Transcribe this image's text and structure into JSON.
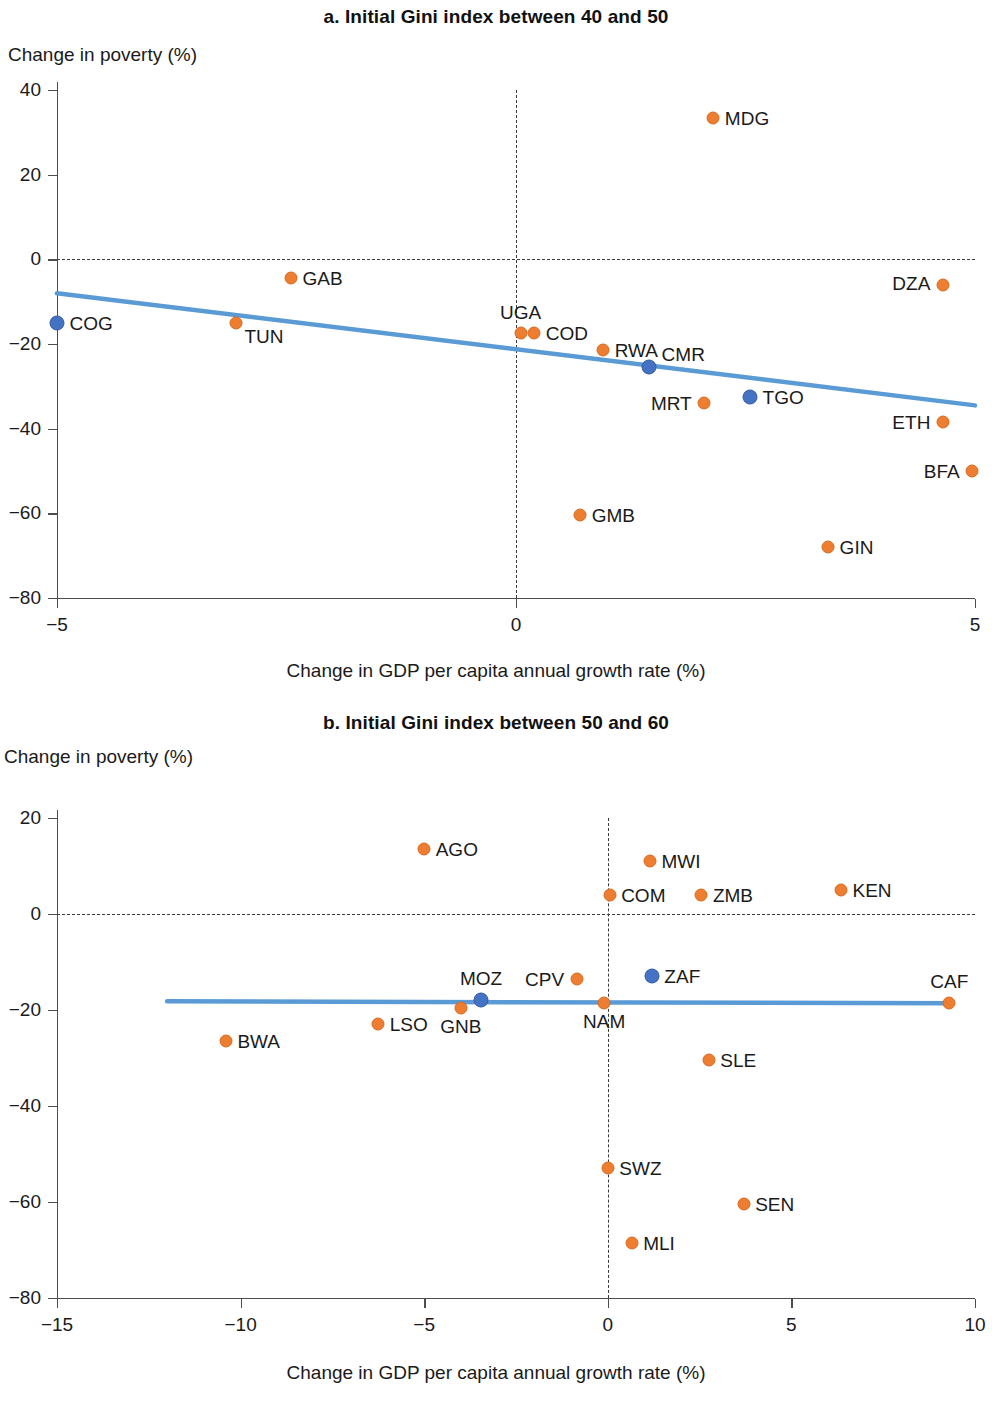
{
  "figure": {
    "shared_xlabel": "Change in GDP per capita annual growth rate (%)",
    "shared_ylabel": "Change in poverty (%)",
    "colors": {
      "orange": "#ED7D31",
      "blue": "#4472C4",
      "trendline": "#5B9BD5",
      "axis": "#4d4d4d"
    }
  },
  "panel_a": {
    "title": "a. Initial Gini index between 40 and 50",
    "ylabel": "Change in poverty (%)",
    "xlabel": "Change in GDP per capita annual growth rate (%)",
    "yticks": [
      "40",
      "20",
      "0",
      "−20",
      "−40",
      "−60",
      "−80"
    ],
    "xticks": [
      "−5",
      "0",
      "5"
    ]
  },
  "panel_b": {
    "title": "b. Initial Gini index between 50 and 60",
    "ylabel": "Change in poverty (%)",
    "xlabel": "Change in GDP per capita annual growth rate (%)",
    "yticks": [
      "20",
      "0",
      "−20",
      "−40",
      "−60",
      "−80"
    ],
    "xticks": [
      "−15",
      "−10",
      "−5",
      "0",
      "5",
      "10"
    ]
  },
  "chart_data": [
    {
      "type": "scatter",
      "panel": "a",
      "title": "a. Initial Gini index between 40 and 50",
      "xlabel": "Change in GDP per capita annual growth rate (%)",
      "ylabel": "Change in poverty (%)",
      "xlim": [
        -5,
        5
      ],
      "ylim": [
        -80,
        40
      ],
      "xticks": [
        -5,
        0,
        5
      ],
      "yticks": [
        40,
        20,
        0,
        -20,
        -40,
        -60,
        -80
      ],
      "grid": false,
      "reference_lines": {
        "horizontal_dashed_y": 0,
        "vertical_dashed_x": 0
      },
      "trendline": {
        "x": [
          -5,
          5
        ],
        "y": [
          -8.0,
          -34.5
        ],
        "color": "#5B9BD5"
      },
      "points": [
        {
          "label": "COG",
          "x": -5.0,
          "y": -15.0,
          "color": "blue",
          "label_pos": "right"
        },
        {
          "label": "TUN",
          "x": -3.05,
          "y": -15.0,
          "color": "orange",
          "label_pos": "right-below"
        },
        {
          "label": "GAB",
          "x": -2.45,
          "y": -4.5,
          "color": "orange",
          "label_pos": "right"
        },
        {
          "label": "UGA",
          "x": 0.05,
          "y": -17.5,
          "color": "orange",
          "label_pos": "above"
        },
        {
          "label": "COD",
          "x": 0.2,
          "y": -17.5,
          "color": "orange",
          "label_pos": "right"
        },
        {
          "label": "RWA",
          "x": 0.95,
          "y": -21.5,
          "color": "orange",
          "label_pos": "right"
        },
        {
          "label": "CMR",
          "x": 1.45,
          "y": -25.5,
          "color": "blue",
          "label_pos": "right-above"
        },
        {
          "label": "MDG",
          "x": 2.15,
          "y": 33.5,
          "color": "orange",
          "label_pos": "right"
        },
        {
          "label": "MRT",
          "x": 2.05,
          "y": -34.0,
          "color": "orange",
          "label_pos": "left"
        },
        {
          "label": "TGO",
          "x": 2.55,
          "y": -32.5,
          "color": "blue",
          "label_pos": "right"
        },
        {
          "label": "DZA",
          "x": 4.65,
          "y": -6.0,
          "color": "orange",
          "label_pos": "left-above"
        },
        {
          "label": "ETH",
          "x": 4.65,
          "y": -38.5,
          "color": "orange",
          "label_pos": "left"
        },
        {
          "label": "BFA",
          "x": 4.97,
          "y": -50.0,
          "color": "orange",
          "label_pos": "left"
        },
        {
          "label": "GMB",
          "x": 0.7,
          "y": -60.5,
          "color": "orange",
          "label_pos": "right"
        },
        {
          "label": "GIN",
          "x": 3.4,
          "y": -68.0,
          "color": "orange",
          "label_pos": "right"
        }
      ]
    },
    {
      "type": "scatter",
      "panel": "b",
      "title": "b. Initial Gini index between 50 and 60",
      "xlabel": "Change in GDP per capita annual growth rate (%)",
      "ylabel": "Change in poverty (%)",
      "xlim": [
        -15,
        10
      ],
      "ylim": [
        -80,
        20
      ],
      "xticks": [
        -15,
        -10,
        -5,
        0,
        5,
        10
      ],
      "yticks": [
        20,
        0,
        -20,
        -40,
        -60,
        -80
      ],
      "grid": false,
      "reference_lines": {
        "horizontal_dashed_y": 0,
        "vertical_dashed_x": 0
      },
      "trendline": {
        "x": [
          -12.0,
          9.3
        ],
        "y": [
          -18.2,
          -18.6
        ],
        "color": "#5B9BD5"
      },
      "points": [
        {
          "label": "AGO",
          "x": -5.0,
          "y": 13.5,
          "color": "orange",
          "label_pos": "right"
        },
        {
          "label": "MWI",
          "x": 1.15,
          "y": 11.0,
          "color": "orange",
          "label_pos": "right"
        },
        {
          "label": "COM",
          "x": 0.05,
          "y": 4.0,
          "color": "orange",
          "label_pos": "right"
        },
        {
          "label": "ZMB",
          "x": 2.55,
          "y": 4.0,
          "color": "orange",
          "label_pos": "right"
        },
        {
          "label": "KEN",
          "x": 6.35,
          "y": 5.0,
          "color": "orange",
          "label_pos": "right"
        },
        {
          "label": "BWA",
          "x": -10.4,
          "y": -26.5,
          "color": "orange",
          "label_pos": "right"
        },
        {
          "label": "LSO",
          "x": -6.25,
          "y": -23.0,
          "color": "orange",
          "label_pos": "right"
        },
        {
          "label": "GNB",
          "x": -4.0,
          "y": -19.5,
          "color": "orange",
          "label_pos": "below"
        },
        {
          "label": "MOZ",
          "x": -3.45,
          "y": -18.0,
          "color": "blue",
          "label_pos": "above"
        },
        {
          "label": "CPV",
          "x": -0.85,
          "y": -13.5,
          "color": "orange",
          "label_pos": "left"
        },
        {
          "label": "NAM",
          "x": -0.1,
          "y": -18.5,
          "color": "orange",
          "label_pos": "below"
        },
        {
          "label": "ZAF",
          "x": 1.2,
          "y": -13.0,
          "color": "blue",
          "label_pos": "right"
        },
        {
          "label": "CAF",
          "x": 9.3,
          "y": -18.5,
          "color": "orange",
          "label_pos": "above"
        },
        {
          "label": "SLE",
          "x": 2.75,
          "y": -30.5,
          "color": "orange",
          "label_pos": "right"
        },
        {
          "label": "SWZ",
          "x": 0.0,
          "y": -53.0,
          "color": "orange",
          "label_pos": "right"
        },
        {
          "label": "SEN",
          "x": 3.7,
          "y": -60.5,
          "color": "orange",
          "label_pos": "right"
        },
        {
          "label": "MLI",
          "x": 0.65,
          "y": -68.5,
          "color": "orange",
          "label_pos": "right"
        }
      ]
    }
  ]
}
